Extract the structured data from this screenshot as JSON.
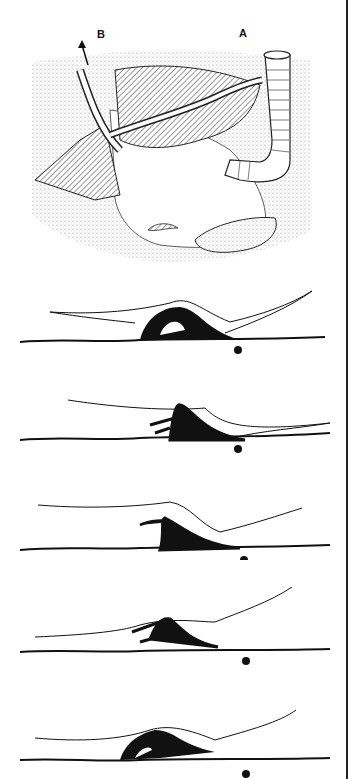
{
  "figure": {
    "top_panel": {
      "labels": {
        "a": "A",
        "b": "B"
      },
      "description": "Snail (whelk) with proboscis feeding into a tube-dwelling worm burrow in sediment; arrows show water current flow"
    },
    "sequence_panels": [
      {
        "index": 1,
        "marker": "dot"
      },
      {
        "index": 2,
        "marker": "dot"
      },
      {
        "index": 3,
        "marker": "dot"
      },
      {
        "index": 4,
        "marker": "dot"
      },
      {
        "index": 5,
        "marker": "dot"
      }
    ],
    "colors": {
      "ink": "#111111",
      "background": "#ffffff",
      "stipple": "#9a9a9a"
    }
  }
}
